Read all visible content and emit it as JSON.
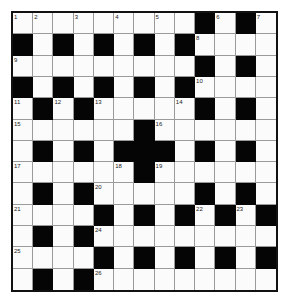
{
  "puzzle": {
    "rows": 13,
    "cols": 13,
    "colors": {
      "block": "#050505",
      "cell": "#fbfbfb",
      "line": "#9a9a9a",
      "border": "#111111"
    },
    "layout": [
      "WWWWWWWWWBWBW",
      "BWBWBWBWBWWWW",
      "WWWWWWWWWBWBW",
      "BWBWBWBWBWWWW",
      "WBWBWWWWWBWBW",
      "WWWWWWBWWWWWW",
      "WBWBWBBBWBWBW",
      "WWWWWWBWWWWWW",
      "WBWBWWWWWBWBW",
      "WWWWBWBWBWBWB",
      "WBWBWWWWWWWWW",
      "WWWWBWBWBWBWB",
      "WBWBWWWWWWWWW"
    ],
    "numbers": [
      {
        "n": "1",
        "r": 0,
        "c": 0
      },
      {
        "n": "2",
        "r": 0,
        "c": 1
      },
      {
        "n": "3",
        "r": 0,
        "c": 3
      },
      {
        "n": "4",
        "r": 0,
        "c": 5
      },
      {
        "n": "5",
        "r": 0,
        "c": 7
      },
      {
        "n": "6",
        "r": 0,
        "c": 10
      },
      {
        "n": "7",
        "r": 0,
        "c": 12
      },
      {
        "n": "8",
        "r": 1,
        "c": 9
      },
      {
        "n": "9",
        "r": 2,
        "c": 0
      },
      {
        "n": "10",
        "r": 3,
        "c": 9
      },
      {
        "n": "11",
        "r": 4,
        "c": 0
      },
      {
        "n": "12",
        "r": 4,
        "c": 2
      },
      {
        "n": "13",
        "r": 4,
        "c": 4
      },
      {
        "n": "14",
        "r": 4,
        "c": 8
      },
      {
        "n": "15",
        "r": 5,
        "c": 0
      },
      {
        "n": "16",
        "r": 5,
        "c": 7
      },
      {
        "n": "17",
        "r": 7,
        "c": 0
      },
      {
        "n": "18",
        "r": 7,
        "c": 5
      },
      {
        "n": "19",
        "r": 7,
        "c": 7
      },
      {
        "n": "20",
        "r": 8,
        "c": 4
      },
      {
        "n": "21",
        "r": 9,
        "c": 0
      },
      {
        "n": "22",
        "r": 9,
        "c": 9
      },
      {
        "n": "23",
        "r": 9,
        "c": 11
      },
      {
        "n": "24",
        "r": 10,
        "c": 4
      },
      {
        "n": "25",
        "r": 11,
        "c": 0
      },
      {
        "n": "26",
        "r": 12,
        "c": 4
      }
    ]
  }
}
